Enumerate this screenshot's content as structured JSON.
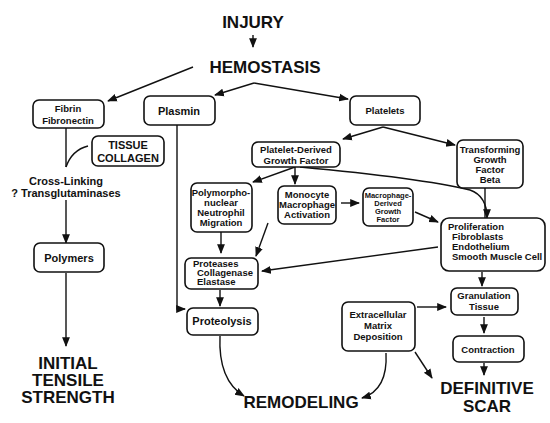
{
  "diagram": {
    "title": "INJURY",
    "stage": "HEMOSTASIS",
    "nodes": {
      "fibrin": [
        "Fibrin",
        "Fibronectin"
      ],
      "tissue_collagen": [
        "TISSUE",
        "COLLAGEN"
      ],
      "cross_linking": [
        "Cross-Linking",
        "? Transglutaminases"
      ],
      "polymers": "Polymers",
      "plasmin": "Plasmin",
      "platelets": "Platelets",
      "pdgf": [
        "Platelet-Derived",
        "Growth Factor"
      ],
      "tgf_beta": [
        "Transforming",
        "Growth",
        "Factor",
        "Beta"
      ],
      "pmn": [
        "Polymorpho-",
        "nuclear",
        "Neutrophil",
        "Migration"
      ],
      "monocyte": [
        "Monocyte",
        "Macrophage",
        "Activation"
      ],
      "mdgf": [
        "Macrophage-",
        "Derived",
        "Growth",
        "Factor"
      ],
      "proliferation": [
        "Proliferation",
        "Fibroblasts",
        "Endothelium",
        "Smooth Muscle Cell"
      ],
      "proteases": [
        "Proteases",
        "Collagenase",
        "Elastase"
      ],
      "proteolysis": "Proteolysis",
      "ecm": [
        "Extracellular",
        "Matrix",
        "Deposition"
      ],
      "granulation": [
        "Granulation",
        "Tissue"
      ],
      "contraction": "Contraction"
    },
    "outcomes": {
      "initial_tensile_strength": [
        "INITIAL",
        "TENSILE",
        "STRENGTH"
      ],
      "remodeling": "REMODELING",
      "definitive_scar": [
        "DEFINITIVE",
        "SCAR"
      ]
    },
    "edges": [
      [
        "INJURY",
        "HEMOSTASIS"
      ],
      [
        "HEMOSTASIS",
        "Fibrin Fibronectin"
      ],
      [
        "HEMOSTASIS",
        "Plasmin"
      ],
      [
        "HEMOSTASIS",
        "Platelets"
      ],
      [
        "Fibrin Fibronectin",
        "Cross-Linking"
      ],
      [
        "TISSUE COLLAGEN",
        "Cross-Linking"
      ],
      [
        "Cross-Linking",
        "Polymers"
      ],
      [
        "Polymers",
        "INITIAL TENSILE STRENGTH"
      ],
      [
        "Platelets",
        "Platelet-Derived Growth Factor"
      ],
      [
        "Platelets",
        "Transforming Growth Factor Beta"
      ],
      [
        "Platelet-Derived Growth Factor",
        "Polymorphonuclear Neutrophil Migration"
      ],
      [
        "Platelet-Derived Growth Factor",
        "Monocyte Macrophage Activation"
      ],
      [
        "Platelet-Derived Growth Factor",
        "Proliferation"
      ],
      [
        "Monocyte Macrophage Activation",
        "Macrophage-Derived Growth Factor"
      ],
      [
        "Macrophage-Derived Growth Factor",
        "Proliferation"
      ],
      [
        "Transforming Growth Factor Beta",
        "Proliferation"
      ],
      [
        "Polymorphonuclear Neutrophil Migration",
        "Proteases"
      ],
      [
        "Monocyte Macrophage Activation",
        "Proteases"
      ],
      [
        "Proliferation",
        "Proteases"
      ],
      [
        "Proteases",
        "Proteolysis"
      ],
      [
        "Plasmin",
        "Proteolysis"
      ],
      [
        "Proliferation",
        "Granulation Tissue"
      ],
      [
        "Extracellular Matrix Deposition",
        "Granulation Tissue"
      ],
      [
        "Granulation Tissue",
        "Contraction"
      ],
      [
        "Contraction",
        "DEFINITIVE SCAR"
      ],
      [
        "Extracellular Matrix Deposition",
        "DEFINITIVE SCAR"
      ],
      [
        "Extracellular Matrix Deposition",
        "REMODELING"
      ],
      [
        "Proteolysis",
        "REMODELING"
      ]
    ]
  }
}
